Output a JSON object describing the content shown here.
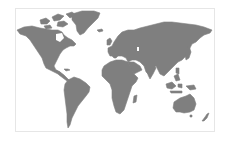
{
  "map": {
    "type": "world-map",
    "projection": "equirectangular-like",
    "land_color": "#7f7f7f",
    "water_color": "#ffffff",
    "frame_color": "#e6e6e6",
    "regions": [
      {
        "id": "north-america",
        "label": "North America"
      },
      {
        "id": "greenland",
        "label": "Greenland"
      },
      {
        "id": "south-america",
        "label": "South America"
      },
      {
        "id": "europe-asia",
        "label": "Eurasia"
      },
      {
        "id": "africa",
        "label": "Africa"
      },
      {
        "id": "australia",
        "label": "Australia"
      },
      {
        "id": "new-zealand",
        "label": "New Zealand"
      },
      {
        "id": "southeast-asia-islands",
        "label": "Southeast Asian Islands"
      },
      {
        "id": "japan",
        "label": "Japan"
      },
      {
        "id": "madagascar",
        "label": "Madagascar"
      },
      {
        "id": "uk",
        "label": "United Kingdom"
      },
      {
        "id": "iceland",
        "label": "Iceland"
      },
      {
        "id": "arctic-islands",
        "label": "Canadian Arctic Archipelago"
      }
    ]
  }
}
